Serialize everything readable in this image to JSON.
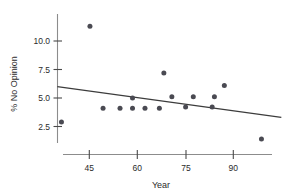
{
  "chart_data": {
    "type": "scatter",
    "title": "",
    "xlabel": "Year",
    "ylabel": "% No Opinion",
    "xlim": [
      33,
      103
    ],
    "ylim": [
      0.3,
      11.9
    ],
    "grid": false,
    "legend": null,
    "xticks": [
      45,
      60,
      75,
      90
    ],
    "xtick_labels": [
      "45",
      "60",
      "75",
      "90"
    ],
    "yticks": [
      2.5,
      5.0,
      7.5,
      10.0
    ],
    "ytick_labels": [
      "2.5",
      "5.0",
      "7.5",
      "10.0"
    ],
    "marker": "filled-circle",
    "marker_color": "#4a4a52",
    "points": [
      {
        "x": 36.3,
        "y": 2.9
      },
      {
        "x": 45.2,
        "y": 11.3
      },
      {
        "x": 49.3,
        "y": 4.1
      },
      {
        "x": 54.6,
        "y": 4.1
      },
      {
        "x": 58.5,
        "y": 5.0
      },
      {
        "x": 58.5,
        "y": 4.1
      },
      {
        "x": 62.4,
        "y": 4.1
      },
      {
        "x": 66.9,
        "y": 4.1
      },
      {
        "x": 68.3,
        "y": 7.2
      },
      {
        "x": 70.8,
        "y": 5.1
      },
      {
        "x": 75.1,
        "y": 4.2
      },
      {
        "x": 77.5,
        "y": 5.1
      },
      {
        "x": 83.4,
        "y": 4.2
      },
      {
        "x": 84.1,
        "y": 5.1
      },
      {
        "x": 87.2,
        "y": 6.1
      },
      {
        "x": 98.8,
        "y": 1.4
      }
    ],
    "fit_line": {
      "type": "linear-regression",
      "color": "#3c3c3c",
      "x_start": 35.0,
      "y_start": 6.0,
      "x_end": 105.0,
      "y_end": 3.3
    },
    "axis_color": "#8c8c8c"
  }
}
